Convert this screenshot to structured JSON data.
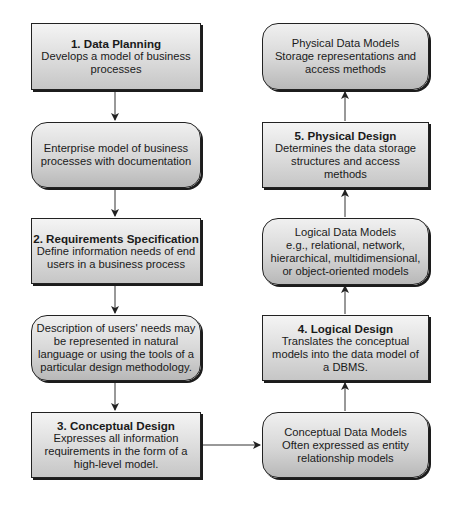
{
  "diagram": {
    "left_column": [
      {
        "id": "data-planning",
        "shape": "rectangle",
        "title": "1. Data Planning",
        "lines": [
          "Develops a model of business",
          "processes"
        ]
      },
      {
        "id": "enterprise-model",
        "shape": "rounded",
        "title": "",
        "lines": [
          "Enterprise model of business",
          "processes with documentation"
        ]
      },
      {
        "id": "requirements-specification",
        "shape": "rectangle",
        "title": "2. Requirements Specification",
        "lines": [
          "Define information needs of end",
          "users in a business process"
        ]
      },
      {
        "id": "users-needs-description",
        "shape": "rounded",
        "title": "",
        "lines": [
          "Description of users' needs may",
          "be represented in natural",
          "language or using the tools of a",
          "particular design methodology."
        ]
      },
      {
        "id": "conceptual-design",
        "shape": "rectangle",
        "title": "3. Conceptual Design",
        "lines": [
          "Expresses all information",
          "requirements in the form of a",
          "high-level model."
        ]
      }
    ],
    "right_column": [
      {
        "id": "physical-data-models",
        "shape": "rounded",
        "title": "",
        "lines": [
          "Physical Data Models",
          "Storage representations and",
          "access methods"
        ]
      },
      {
        "id": "physical-design",
        "shape": "rectangle",
        "title": "5. Physical Design",
        "lines": [
          "Determines the data storage",
          "structures and access",
          "methods"
        ]
      },
      {
        "id": "logical-data-models",
        "shape": "rounded",
        "title": "",
        "lines": [
          "Logical Data Models",
          "e.g., relational, network,",
          "hierarchical, multidimensional,",
          "or object-oriented models"
        ]
      },
      {
        "id": "logical-design",
        "shape": "rectangle",
        "title": "4. Logical Design",
        "lines": [
          "Translates the conceptual",
          "models into the data model of",
          "a DBMS."
        ]
      },
      {
        "id": "conceptual-data-models",
        "shape": "rounded",
        "title": "",
        "lines": [
          "Conceptual Data Models",
          "Often expressed as entity",
          "relationship models"
        ]
      }
    ],
    "edges": [
      {
        "from": "data-planning",
        "to": "enterprise-model",
        "direction": "down"
      },
      {
        "from": "enterprise-model",
        "to": "requirements-specification",
        "direction": "down"
      },
      {
        "from": "requirements-specification",
        "to": "users-needs-description",
        "direction": "down"
      },
      {
        "from": "users-needs-description",
        "to": "conceptual-design",
        "direction": "down"
      },
      {
        "from": "conceptual-design",
        "to": "conceptual-data-models",
        "direction": "right"
      },
      {
        "from": "conceptual-data-models",
        "to": "logical-design",
        "direction": "up"
      },
      {
        "from": "logical-design",
        "to": "logical-data-models",
        "direction": "up"
      },
      {
        "from": "logical-data-models",
        "to": "physical-design",
        "direction": "up"
      },
      {
        "from": "physical-design",
        "to": "physical-data-models",
        "direction": "up"
      }
    ],
    "colors": {
      "border": "#222222",
      "fill_light": "#f4f4f4",
      "fill_dark": "#c6c6c6",
      "arrow": "#333333"
    }
  }
}
